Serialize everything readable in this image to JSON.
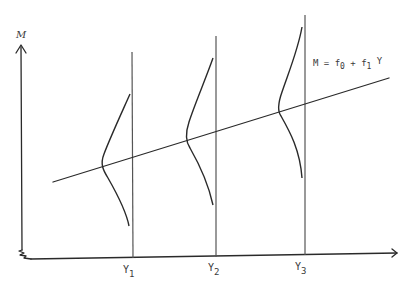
{
  "diagram": {
    "y_axis_label": "M",
    "equation": {
      "lhs": "M = f",
      "sub0": "0",
      "plus": " + f",
      "sub1": "1",
      "var": " Y"
    },
    "x_ticks": [
      {
        "label": "Y",
        "sub": "1"
      },
      {
        "label": "Y",
        "sub": "2"
      },
      {
        "label": "Y",
        "sub": "3"
      }
    ],
    "colors": {
      "line": "#2a2a2a",
      "vertical": "#555555",
      "background": "#ffffff"
    }
  }
}
